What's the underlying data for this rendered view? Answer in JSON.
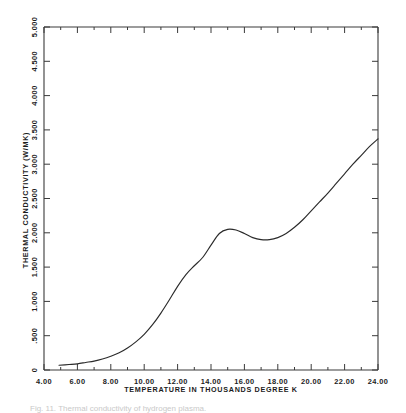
{
  "figure": {
    "background_color": "#ffffff",
    "line_color": "#2b2b2b",
    "axis_color": "#3a3a3a",
    "caption": "Fig. 11. Thermal conductivity of hydrogen plasma."
  },
  "chart_data": {
    "type": "line",
    "title": "",
    "xlabel": "TEMPERATURE IN THOUSANDS DEGREE K",
    "ylabel": "THERMAL CONDUCTIVITY (W/MK)",
    "xlim": [
      4.0,
      24.0
    ],
    "ylim": [
      0,
      5.0
    ],
    "grid": false,
    "legend": "none",
    "x_ticks": [
      4.0,
      6.0,
      8.0,
      10.0,
      12.0,
      14.0,
      16.0,
      18.0,
      20.0,
      22.0,
      24.0
    ],
    "x_tick_labels": [
      "4.00",
      "6.00",
      "8.00",
      "10.00",
      "12.00",
      "14.00",
      "16.00",
      "18.00",
      "20.00",
      "22.00",
      "24.00"
    ],
    "y_ticks": [
      0,
      0.5,
      1.0,
      1.5,
      2.0,
      2.5,
      3.0,
      3.5,
      4.0,
      4.5,
      5.0
    ],
    "y_tick_labels": [
      "0",
      ".500",
      "1.000",
      "1.500",
      "2.000",
      "2.500",
      "3.000",
      "3.500",
      "4.000",
      "4.500",
      "5.000"
    ],
    "x_minor_ticks": [
      5.0,
      7.0,
      9.0,
      11.0,
      13.0,
      15.0,
      17.0,
      19.0,
      21.0,
      23.0
    ],
    "series": [
      {
        "name": "thermal conductivity",
        "x": [
          4.9,
          5.5,
          6.0,
          6.5,
          7.0,
          7.5,
          8.0,
          8.5,
          9.0,
          9.5,
          10.0,
          10.5,
          11.0,
          11.5,
          12.0,
          12.5,
          13.0,
          13.5,
          14.0,
          14.5,
          15.0,
          15.5,
          16.0,
          16.5,
          17.0,
          17.5,
          18.0,
          18.5,
          19.0,
          19.5,
          20.0,
          20.5,
          21.0,
          21.5,
          22.0,
          22.5,
          23.0,
          23.5,
          24.0
        ],
        "y": [
          0.07,
          0.08,
          0.09,
          0.11,
          0.13,
          0.16,
          0.2,
          0.25,
          0.32,
          0.41,
          0.52,
          0.66,
          0.83,
          1.02,
          1.22,
          1.39,
          1.52,
          1.64,
          1.82,
          1.99,
          2.05,
          2.04,
          1.99,
          1.93,
          1.9,
          1.9,
          1.93,
          1.99,
          2.08,
          2.19,
          2.32,
          2.45,
          2.58,
          2.72,
          2.86,
          3.0,
          3.13,
          3.26,
          3.37
        ]
      }
    ]
  }
}
